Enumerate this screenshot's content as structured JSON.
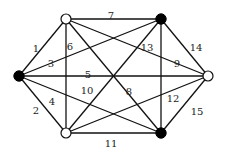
{
  "diagram": {
    "type": "graph",
    "nodes": [
      {
        "id": "A",
        "x": 66,
        "y": 19,
        "style": "open"
      },
      {
        "id": "B",
        "x": 161,
        "y": 19,
        "style": "filled"
      },
      {
        "id": "C",
        "x": 19,
        "y": 76,
        "style": "filled"
      },
      {
        "id": "D",
        "x": 208,
        "y": 76,
        "style": "open"
      },
      {
        "id": "E",
        "x": 66,
        "y": 133,
        "style": "open"
      },
      {
        "id": "F",
        "x": 161,
        "y": 133,
        "style": "filled"
      }
    ],
    "edges": [
      {
        "label": "1",
        "from": "C",
        "to": "A",
        "lx": 36,
        "ly": 49
      },
      {
        "label": "2",
        "from": "C",
        "to": "E",
        "lx": 36,
        "ly": 111
      },
      {
        "label": "3",
        "from": "C",
        "to": "B",
        "lx": 51,
        "ly": 64
      },
      {
        "label": "4",
        "from": "C",
        "to": "F",
        "lx": 52,
        "ly": 102
      },
      {
        "label": "5",
        "from": "C",
        "to": "D",
        "lx": 88,
        "ly": 75
      },
      {
        "label": "6",
        "from": "A",
        "to": "E",
        "lx": 70,
        "ly": 47
      },
      {
        "label": "7",
        "from": "A",
        "to": "B",
        "lx": 111,
        "ly": 16
      },
      {
        "label": "8",
        "from": "A",
        "to": "F",
        "lx": 129,
        "ly": 92
      },
      {
        "label": "9",
        "from": "A",
        "to": "D",
        "lx": 177,
        "ly": 64
      },
      {
        "label": "10",
        "from": "E",
        "to": "B",
        "lx": 87,
        "ly": 91
      },
      {
        "label": "11",
        "from": "E",
        "to": "F",
        "lx": 111,
        "ly": 144
      },
      {
        "label": "12",
        "from": "E",
        "to": "D",
        "lx": 173,
        "ly": 99
      },
      {
        "label": "13",
        "from": "B",
        "to": "F",
        "lx": 147,
        "ly": 48
      },
      {
        "label": "14",
        "from": "B",
        "to": "D",
        "lx": 196,
        "ly": 48
      },
      {
        "label": "15",
        "from": "F",
        "to": "D",
        "lx": 197,
        "ly": 112
      }
    ]
  }
}
